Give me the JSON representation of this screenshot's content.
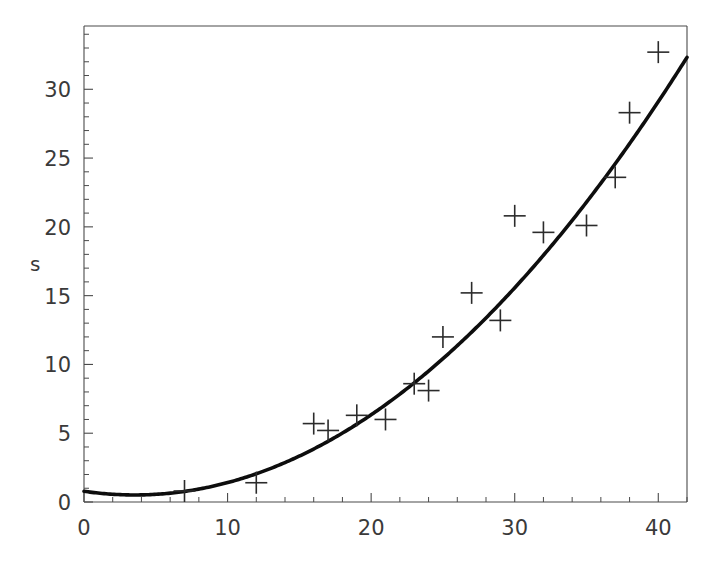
{
  "chart_data": {
    "type": "scatter",
    "title": "",
    "subtitle": "",
    "xlabel": "",
    "ylabel": "s",
    "xlim": [
      0,
      42
    ],
    "ylim": [
      0,
      34.6
    ],
    "grid": false,
    "legend": null,
    "x_ticks": [
      0,
      10,
      20,
      30,
      40
    ],
    "x_tick_labels": [
      "0",
      "10",
      "20",
      "30",
      "40"
    ],
    "x_minor_step": 2,
    "y_ticks": [
      0,
      5,
      10,
      15,
      20,
      25,
      30
    ],
    "y_tick_labels": [
      "0",
      "5",
      "10",
      "15",
      "20",
      "25",
      "30"
    ],
    "y_minor_step": 1,
    "marker": "plus",
    "marker_color": "#2b2b2b",
    "curve_color": "#0d0d0d",
    "series": [
      {
        "name": "observations",
        "type": "scatter",
        "x": [
          7,
          12,
          16,
          17,
          19,
          21,
          23,
          24,
          25,
          27,
          29,
          30,
          32,
          35,
          37,
          38,
          40
        ],
        "y": [
          0.8,
          1.4,
          5.7,
          5.2,
          6.3,
          6.0,
          8.6,
          8.1,
          12.0,
          15.2,
          13.2,
          20.8,
          19.6,
          20.1,
          23.6,
          28.3,
          32.7
        ]
      },
      {
        "name": "fitted-curve",
        "type": "line",
        "fit": "quadratic",
        "equation_coefficients": {
          "a": 0.0215,
          "b": -0.152,
          "c": 0.78
        },
        "x_range": [
          0,
          42
        ],
        "sample_x": [
          0,
          2,
          4,
          6,
          8,
          10,
          12,
          14,
          16,
          18,
          20,
          22,
          24,
          26,
          28,
          30,
          32,
          34,
          36,
          38,
          40,
          42
        ],
        "sample_y": [
          0.78,
          0.56,
          0.52,
          0.64,
          0.94,
          1.41,
          2.05,
          2.86,
          3.84,
          4.99,
          6.32,
          7.81,
          9.48,
          11.31,
          13.32,
          15.5,
          17.85,
          20.37,
          23.06,
          25.93,
          28.96,
          32.17
        ]
      }
    ]
  },
  "axis": {
    "y_title": "s",
    "x_title": ""
  },
  "geometry": {
    "frame_left": 84,
    "frame_right": 687,
    "frame_top": 26,
    "frame_bottom": 502,
    "px_per_x_unit": 14.32,
    "px_per_y_unit": 13.5
  }
}
